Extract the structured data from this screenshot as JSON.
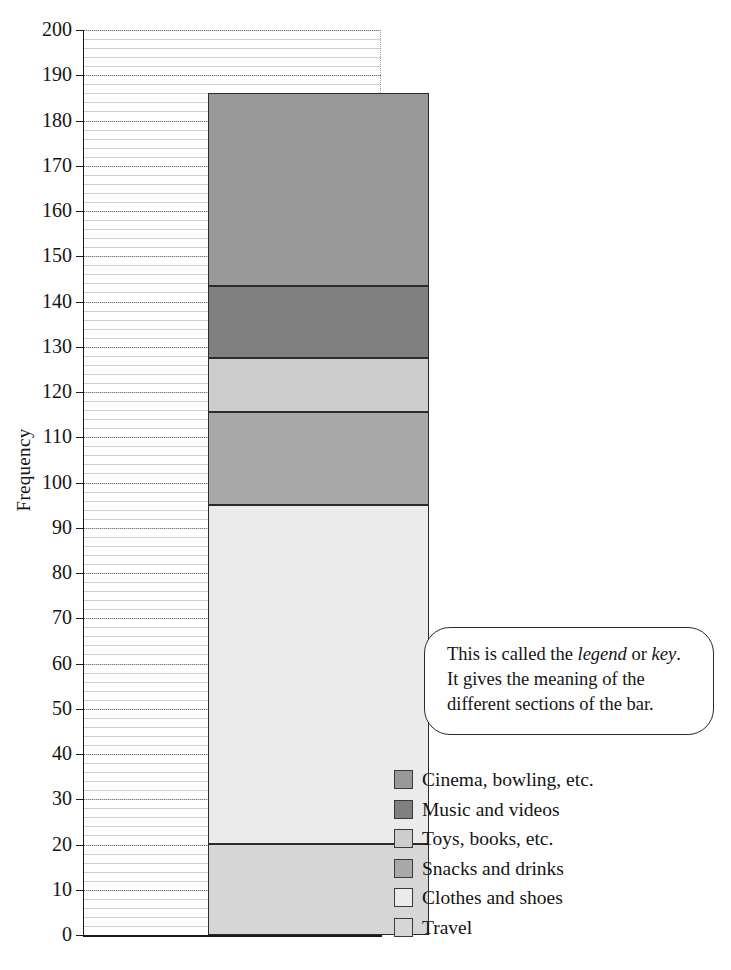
{
  "chart_data": {
    "type": "bar",
    "subtype": "stacked-bar-single",
    "title": "",
    "xlabel": "",
    "ylabel": "Frequency",
    "ylim": [
      0,
      200
    ],
    "ytick_step": 10,
    "grid": true,
    "grid_orientation": "horizontal",
    "legend_position": "right-bottom",
    "categories": [
      "Spending"
    ],
    "total": 186,
    "yticks": [
      0,
      10,
      20,
      30,
      40,
      50,
      60,
      70,
      80,
      90,
      100,
      110,
      120,
      130,
      140,
      150,
      160,
      170,
      180,
      190,
      200
    ],
    "series": [
      {
        "name": "Travel",
        "values": [
          20
        ],
        "start": 0,
        "end": 20,
        "color": "#d6d6d6"
      },
      {
        "name": "Clothes and shoes",
        "values": [
          75
        ],
        "start": 20,
        "end": 95,
        "color": "#ebebeb"
      },
      {
        "name": "Snacks and drinks",
        "values": [
          20.5
        ],
        "start": 95,
        "end": 115.5,
        "color": "#a8a8a8"
      },
      {
        "name": "Toys, books, etc.",
        "values": [
          12
        ],
        "start": 115.5,
        "end": 127.5,
        "color": "#cdcdcd"
      },
      {
        "name": "Music and videos",
        "values": [
          16
        ],
        "start": 127.5,
        "end": 143.5,
        "color": "#808080"
      },
      {
        "name": "Cinema, bowling, etc.",
        "values": [
          42.5
        ],
        "start": 143.5,
        "end": 186,
        "color": "#999999"
      }
    ],
    "annotations": [
      {
        "text": "This is called the legend or key. It gives the meaning of the different sections of the bar."
      }
    ]
  },
  "legend": {
    "items": [
      {
        "label": "Cinema, bowling, etc.",
        "color": "#999999"
      },
      {
        "label": "Music and videos",
        "color": "#808080"
      },
      {
        "label": "Toys, books, etc.",
        "color": "#cdcdcd"
      },
      {
        "label": "Snacks and drinks",
        "color": "#a8a8a8"
      },
      {
        "label": "Clothes and shoes",
        "color": "#ebebeb"
      },
      {
        "label": "Travel",
        "color": "#d6d6d6"
      }
    ]
  },
  "callout": {
    "line1_before": "This is called the ",
    "line1_em1": "legend",
    "line1_mid": " or ",
    "line1_em2": "key",
    "line1_after": ".",
    "line2": "It gives the meaning of the",
    "line3": "different sections of the bar."
  },
  "axis": {
    "ylabel": "Frequency",
    "ticklabels": [
      "200",
      "190",
      "180",
      "170",
      "160",
      "150",
      "140",
      "130",
      "120",
      "110",
      "100",
      "90",
      "80",
      "70",
      "60",
      "50",
      "40",
      "30",
      "20",
      "10",
      "0"
    ]
  }
}
